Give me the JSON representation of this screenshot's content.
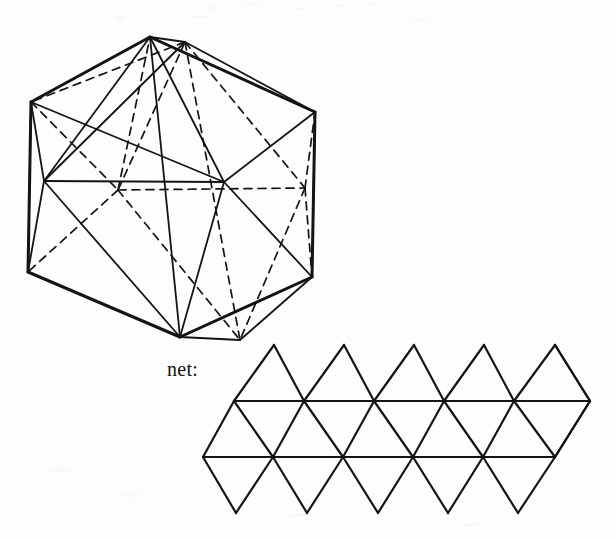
{
  "page": {
    "background_color": "#fdfdfc",
    "ink_color": "#161412",
    "width": 616,
    "height": 539
  },
  "labels": {
    "net": "net:"
  },
  "figures": [
    {
      "name": "icosahedron-perspective",
      "description": "Icosahedron drawn with hexagonal silhouette, solid visible edges and dashed hidden edges",
      "visible_edge_style": "solid",
      "hidden_edge_style": "dashed",
      "faces": 20,
      "vertices": 12,
      "edges": 30
    },
    {
      "name": "icosahedron-net",
      "description": "Net of the icosahedron: strip of twenty equilateral triangles in two staggered rows",
      "triangle_count": 20,
      "rows": 2,
      "columns": 10
    }
  ],
  "geometry": {
    "solid": {
      "outline": [
        [
          150,
          37
        ],
        [
          315,
          112
        ],
        [
          312,
          277
        ],
        [
          180,
          337
        ],
        [
          28,
          272
        ],
        [
          31,
          102
        ]
      ],
      "solid_polylines": [
        [
          [
            150,
            37
          ],
          [
            315,
            112
          ]
        ],
        [
          [
            315,
            112
          ],
          [
            312,
            277
          ]
        ],
        [
          [
            312,
            277
          ],
          [
            180,
            337
          ]
        ],
        [
          [
            180,
            337
          ],
          [
            28,
            272
          ]
        ],
        [
          [
            28,
            272
          ],
          [
            31,
            102
          ]
        ],
        [
          [
            31,
            102
          ],
          [
            150,
            37
          ]
        ],
        [
          [
            150,
            37
          ],
          [
            185,
            42
          ]
        ],
        [
          [
            185,
            42
          ],
          [
            315,
            112
          ]
        ],
        [
          [
            180,
            337
          ],
          [
            240,
            340
          ]
        ],
        [
          [
            240,
            340
          ],
          [
            312,
            277
          ]
        ],
        [
          [
            31,
            102
          ],
          [
            44,
            181
          ]
        ],
        [
          [
            44,
            181
          ],
          [
            28,
            272
          ]
        ],
        [
          [
            44,
            181
          ],
          [
            224,
            182
          ]
        ],
        [
          [
            150,
            37
          ],
          [
            44,
            181
          ]
        ],
        [
          [
            150,
            37
          ],
          [
            224,
            182
          ]
        ],
        [
          [
            224,
            182
          ],
          [
            315,
            112
          ]
        ],
        [
          [
            44,
            181
          ],
          [
            180,
            337
          ]
        ],
        [
          [
            224,
            182
          ],
          [
            180,
            337
          ]
        ],
        [
          [
            224,
            182
          ],
          [
            312,
            277
          ]
        ],
        [
          [
            150,
            37
          ],
          [
            180,
            337
          ]
        ],
        [
          [
            31,
            102
          ],
          [
            224,
            182
          ]
        ],
        [
          [
            44,
            181
          ],
          [
            185,
            42
          ]
        ]
      ],
      "dashed_polylines": [
        [
          [
            185,
            42
          ],
          [
            118,
            190
          ]
        ],
        [
          [
            185,
            42
          ],
          [
            305,
            188
          ]
        ],
        [
          [
            118,
            190
          ],
          [
            305,
            188
          ]
        ],
        [
          [
            118,
            190
          ],
          [
            240,
            340
          ]
        ],
        [
          [
            305,
            188
          ],
          [
            240,
            340
          ]
        ],
        [
          [
            185,
            42
          ],
          [
            240,
            340
          ]
        ],
        [
          [
            31,
            102
          ],
          [
            118,
            190
          ]
        ],
        [
          [
            118,
            190
          ],
          [
            28,
            272
          ]
        ],
        [
          [
            305,
            188
          ],
          [
            315,
            112
          ]
        ],
        [
          [
            305,
            188
          ],
          [
            312,
            277
          ]
        ],
        [
          [
            118,
            190
          ],
          [
            150,
            37
          ]
        ],
        [
          [
            185,
            42
          ],
          [
            31,
            102
          ]
        ]
      ]
    },
    "net": {
      "top_y": 345,
      "mid_upper_y": 401,
      "mid_lower_y": 457,
      "bottom_y": 513,
      "top_vertices_x": [
        274,
        344,
        414,
        484,
        555
      ],
      "upper_row_x": [
        234,
        304,
        374,
        444,
        514,
        590
      ],
      "lower_row_x": [
        203,
        273,
        343,
        413,
        483,
        555
      ],
      "bottom_vertices_x": [
        236,
        307,
        378,
        448,
        518
      ]
    }
  }
}
